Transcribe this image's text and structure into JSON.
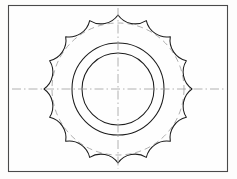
{
  "document": {
    "title": "Sprocket Technical Drawing",
    "background_color": "#fdfdfc",
    "border_color": "#4a4a4a",
    "line_color": "#1c1c1c",
    "construction_color": "#9a9a9a",
    "centerline_color": "#a0a0a0"
  },
  "sheet": {
    "x": 8,
    "y": 5,
    "width": 220,
    "height": 167
  },
  "chart_data": {
    "type": "diagram",
    "subtitle": "Sixteen-tooth cusped sprocket, orthographic front view",
    "center": {
      "x": 118,
      "y": 89
    },
    "tooth_count": 16,
    "outer_tip_radius": 74,
    "root_circle_radius": 61,
    "scallop_arc_radius": 21,
    "construction_circle_radius": 66,
    "hub_outer_radius": 46,
    "hub_inner_radius": 36,
    "centerlines": {
      "horizontal": {
        "x1": 12,
        "y1": 89,
        "x2": 224,
        "y2": 89
      },
      "vertical": {
        "x1": 118,
        "y1": 8,
        "x2": 118,
        "y2": 169
      }
    },
    "features": [
      "cusped tooth profile formed by concave circular arcs",
      "tooth tips terminate in sharp points on the tip circle",
      "dashed construction circle through the tooth roots",
      "two concentric hub circles at the centre",
      "dash-dot horizontal and vertical centrelines",
      "thin rectangular drawing-sheet border"
    ],
    "xlabel": "",
    "ylabel": "",
    "grid": false,
    "legend": "none"
  }
}
